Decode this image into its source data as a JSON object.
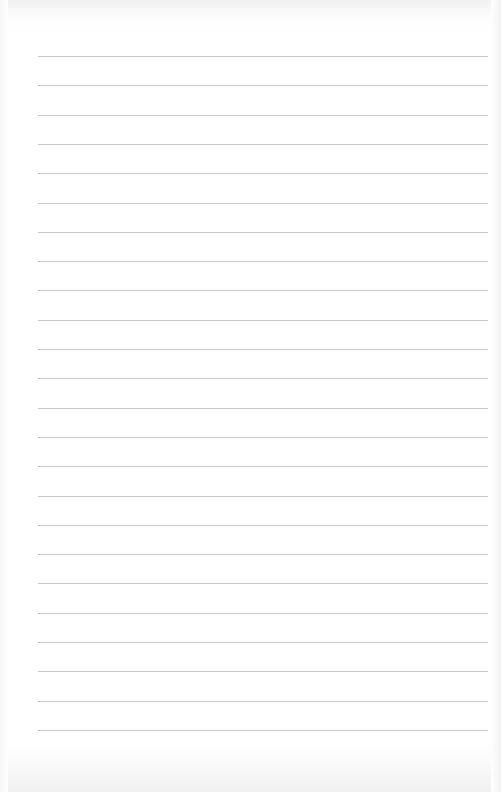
{
  "document": {
    "type": "lined-paper",
    "background_color": "#ffffff",
    "rule_color": "#c6c6c6",
    "rule_count": 24,
    "first_rule_y": 56,
    "rule_spacing": 29.3,
    "rule_left": 38,
    "rule_width": 450,
    "text_lines": []
  }
}
